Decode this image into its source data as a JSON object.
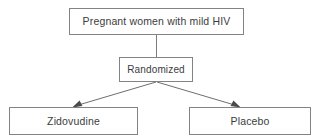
{
  "diagram": {
    "type": "flowchart",
    "background_color": "#ffffff",
    "box_border_color": "#838383",
    "text_color": "#3c3c3c",
    "connector_color": "#7d7d7d",
    "arrowhead_color": "#4a4a4a",
    "nodes": {
      "population": {
        "label": "Pregnant women with mild HIV",
        "level": "top"
      },
      "randomized": {
        "label": "Randomized",
        "level": "middle"
      },
      "treatment_arm": {
        "label": "Zidovudine",
        "level": "bottom"
      },
      "control_arm": {
        "label": "Placebo",
        "level": "bottom"
      }
    },
    "edges": [
      {
        "from": "population",
        "to": "randomized",
        "style": "plain-line",
        "arrowhead": false
      },
      {
        "from": "randomized",
        "to": "treatment_arm",
        "style": "diagonal",
        "arrowhead": true
      },
      {
        "from": "randomized",
        "to": "control_arm",
        "style": "diagonal",
        "arrowhead": true
      }
    ]
  }
}
